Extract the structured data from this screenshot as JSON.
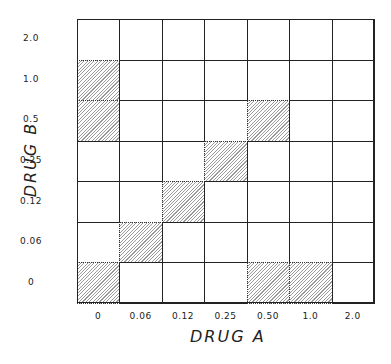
{
  "chart_data": {
    "type": "heatmap",
    "title": "",
    "xlabel": "DRUG A",
    "ylabel": "DRUG B",
    "x_categories": [
      "0",
      "0.06",
      "0.12",
      "0.25",
      "0.50",
      "1.0",
      "2.0"
    ],
    "y_categories_top_to_bottom": [
      "2.0",
      "1.0",
      "0.5",
      "0.25",
      "0.12",
      "0.06",
      "0"
    ],
    "grid": true,
    "legend": null,
    "shaded_cells": [
      {
        "drug_a": "0",
        "drug_b": "1.0"
      },
      {
        "drug_a": "0",
        "drug_b": "0.5"
      },
      {
        "drug_a": "0.50",
        "drug_b": "0.5"
      },
      {
        "drug_a": "0.25",
        "drug_b": "0.25"
      },
      {
        "drug_a": "0.12",
        "drug_b": "0.12"
      },
      {
        "drug_a": "0.06",
        "drug_b": "0.06"
      },
      {
        "drug_a": "0",
        "drug_b": "0"
      },
      {
        "drug_a": "0.50",
        "drug_b": "0"
      },
      {
        "drug_a": "1.0",
        "drug_b": "0"
      }
    ],
    "matrix_top_to_bottom": [
      [
        0,
        0,
        0,
        0,
        0,
        0,
        0
      ],
      [
        1,
        0,
        0,
        0,
        0,
        0,
        0
      ],
      [
        1,
        0,
        0,
        0,
        1,
        0,
        0
      ],
      [
        0,
        0,
        0,
        1,
        0,
        0,
        0
      ],
      [
        0,
        0,
        1,
        0,
        0,
        0,
        0
      ],
      [
        0,
        1,
        0,
        0,
        0,
        0,
        0
      ],
      [
        1,
        0,
        0,
        0,
        1,
        1,
        0
      ]
    ]
  }
}
